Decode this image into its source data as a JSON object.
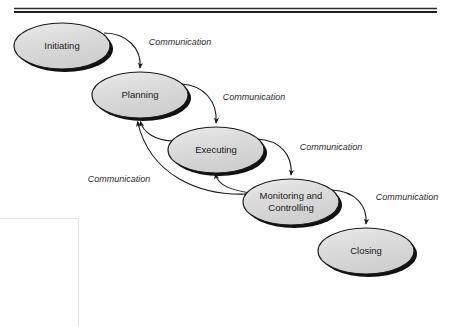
{
  "figure": {
    "type": "process-flow-diagram",
    "colors": {
      "node_fill": "#d9d9d9",
      "node_fill_highlight": "#ececec",
      "node_stroke": "#1a1a1a",
      "node_shadow": "#111111",
      "edge_stroke": "#1a1a1a",
      "label_text": "#2b2b2b",
      "node_text": "#1a1a1a",
      "rule": "#1f1f1f",
      "background": "#ffffff",
      "scan_artifact": "#e6e6e6"
    },
    "top_rule": {
      "present": true,
      "style": "double-line",
      "x_start": 14,
      "x_end": 437,
      "y": 10
    },
    "nodes": [
      {
        "id": "initiating",
        "label": "Initiating",
        "lines": [
          "Initiating"
        ],
        "cx": 62,
        "cy": 46,
        "rx": 48,
        "ry": 23
      },
      {
        "id": "planning",
        "label": "Planning",
        "lines": [
          "Planning"
        ],
        "cx": 140,
        "cy": 95,
        "rx": 48,
        "ry": 23
      },
      {
        "id": "executing",
        "label": "Executing",
        "lines": [
          "Executing"
        ],
        "cx": 216,
        "cy": 150,
        "rx": 48,
        "ry": 23
      },
      {
        "id": "monitoring-and-controlling",
        "label": "Monitoring and Controlling",
        "lines": [
          "Monitoring and",
          "Controlling"
        ],
        "cx": 291,
        "cy": 202,
        "rx": 48,
        "ry": 23
      },
      {
        "id": "closing",
        "label": "Closing",
        "lines": [
          "Closing"
        ],
        "cx": 366,
        "cy": 251,
        "rx": 48,
        "ry": 23
      }
    ],
    "edges": [
      {
        "id": "initiating-to-planning",
        "from": "initiating",
        "to": "planning",
        "label": "Communication",
        "label_x": 180,
        "label_y": 43,
        "direction": "forward"
      },
      {
        "id": "planning-to-executing",
        "from": "planning",
        "to": "executing",
        "label": "Communication",
        "label_x": 254,
        "label_y": 98,
        "direction": "forward"
      },
      {
        "id": "executing-to-monitoring",
        "from": "executing",
        "to": "monitoring-and-controlling",
        "label": "Communication",
        "label_x": 331,
        "label_y": 148,
        "direction": "forward"
      },
      {
        "id": "monitoring-to-closing",
        "from": "monitoring-and-controlling",
        "to": "closing",
        "label": "Communication",
        "label_x": 407,
        "label_y": 198,
        "direction": "forward"
      },
      {
        "id": "executing-to-planning-feedback",
        "from": "executing",
        "to": "planning",
        "label": "Communication",
        "label_x": 119,
        "label_y": 180,
        "direction": "feedback"
      },
      {
        "id": "monitoring-to-planning-feedback",
        "from": "monitoring-and-controlling",
        "to": "planning",
        "label": "",
        "direction": "feedback"
      },
      {
        "id": "monitoring-to-executing-feedback",
        "from": "monitoring-and-controlling",
        "to": "executing",
        "label": "",
        "direction": "feedback"
      }
    ]
  }
}
